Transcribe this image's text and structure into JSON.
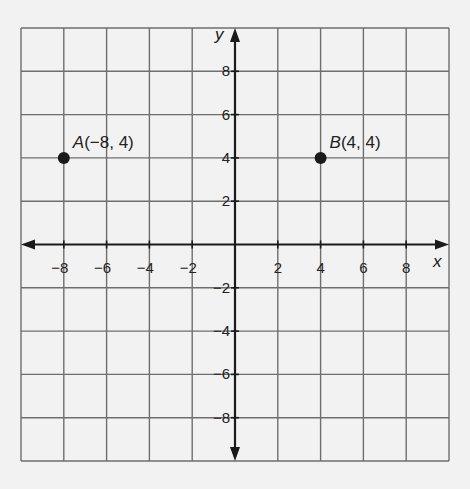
{
  "chart_data": {
    "type": "scatter",
    "title": "",
    "xlabel": "x",
    "ylabel": "y",
    "xlim": [
      -10,
      10
    ],
    "ylim": [
      -10,
      10
    ],
    "grid": true,
    "grid_step": 2,
    "x_ticks": [
      -8,
      -6,
      -4,
      -2,
      2,
      4,
      6,
      8
    ],
    "y_ticks": [
      8,
      6,
      4,
      2,
      -2,
      -4,
      -6,
      -8
    ],
    "x_tick_labels": [
      "−8",
      "−6",
      "−4",
      "−2",
      "2",
      "4",
      "6",
      "8"
    ],
    "y_tick_labels": [
      "8",
      "6",
      "4",
      "2",
      "−2",
      "−4",
      "−6",
      "−8"
    ],
    "points": [
      {
        "name": "A",
        "x": -8,
        "y": 4,
        "label": "(−8, 4)"
      },
      {
        "name": "B",
        "x": 4,
        "y": 4,
        "label": "(4, 4)"
      }
    ],
    "colors": {
      "grid": "#6e6e6e",
      "axis": "#1a1a1a",
      "point": "#1a1a1a",
      "background": "#f2f2f2"
    }
  }
}
